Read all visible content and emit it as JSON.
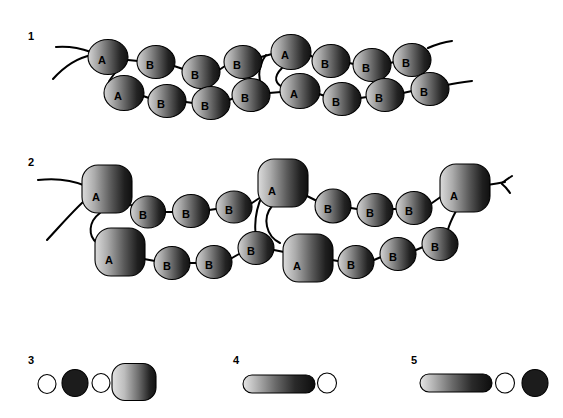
{
  "figure": {
    "background_color": "#ffffff",
    "ink_color": "#000000"
  },
  "panels": [
    {
      "id": "panel-1",
      "number": "1",
      "number_x": 28,
      "number_y": 31,
      "type": "double-chain",
      "subunit_style": "oval",
      "chains": [
        {
          "name": "upper-strand",
          "subunits": [
            {
              "label": "A",
              "cx": 108,
              "cy": 57,
              "rx": 20,
              "ry": 17.5,
              "shape": "oval"
            },
            {
              "label": "B",
              "cx": 156,
              "cy": 62,
              "rx": 19,
              "ry": 16.5,
              "shape": "oval"
            },
            {
              "label": "B",
              "cx": 201,
              "cy": 72,
              "rx": 19,
              "ry": 16.5,
              "shape": "oval"
            },
            {
              "label": "B",
              "cx": 243,
              "cy": 62,
              "rx": 19,
              "ry": 16.5,
              "shape": "oval"
            },
            {
              "label": "A",
              "cx": 291,
              "cy": 52,
              "rx": 20,
              "ry": 17.5,
              "shape": "oval"
            },
            {
              "label": "B",
              "cx": 331,
              "cy": 61,
              "rx": 19,
              "ry": 16.5,
              "shape": "oval"
            },
            {
              "label": "B",
              "cx": 372,
              "cy": 65,
              "rx": 19,
              "ry": 16.5,
              "shape": "oval"
            },
            {
              "label": "B",
              "cx": 412,
              "cy": 60,
              "rx": 19,
              "ry": 16.5,
              "shape": "oval"
            }
          ]
        },
        {
          "name": "lower-strand",
          "subunits": [
            {
              "label": "A",
              "cx": 124,
              "cy": 93,
              "rx": 20,
              "ry": 17.5,
              "shape": "oval"
            },
            {
              "label": "B",
              "cx": 167,
              "cy": 101,
              "rx": 19,
              "ry": 16.5,
              "shape": "oval"
            },
            {
              "label": "B",
              "cx": 211,
              "cy": 103,
              "rx": 19,
              "ry": 16.5,
              "shape": "oval"
            },
            {
              "label": "B",
              "cx": 251,
              "cy": 95,
              "rx": 19,
              "ry": 16.5,
              "shape": "oval"
            },
            {
              "label": "A",
              "cx": 300,
              "cy": 91,
              "rx": 20,
              "ry": 17.5,
              "shape": "oval"
            },
            {
              "label": "B",
              "cx": 342,
              "cy": 99,
              "rx": 19,
              "ry": 16.5,
              "shape": "oval"
            },
            {
              "label": "B",
              "cx": 385,
              "cy": 95,
              "rx": 19,
              "ry": 16.5,
              "shape": "oval"
            },
            {
              "label": "B",
              "cx": 430,
              "cy": 89,
              "rx": 19,
              "ry": 16.5,
              "shape": "oval"
            }
          ]
        }
      ]
    },
    {
      "id": "panel-2",
      "number": "2",
      "number_x": 28,
      "number_y": 157,
      "type": "double-chain",
      "subunit_style": "rounded-square-A",
      "chains": [
        {
          "name": "upper-strand",
          "subunits": [
            {
              "label": "A",
              "cx": 107,
              "cy": 189,
              "rx": 25,
              "ry": 24,
              "shape": "rounded-square"
            },
            {
              "label": "B",
              "cx": 148,
              "cy": 212,
              "rx": 17.5,
              "ry": 16,
              "shape": "oval"
            },
            {
              "label": "B",
              "cx": 191,
              "cy": 211,
              "rx": 18.5,
              "ry": 16.5,
              "shape": "oval"
            },
            {
              "label": "B",
              "cx": 234,
              "cy": 207,
              "rx": 18,
              "ry": 16,
              "shape": "oval"
            },
            {
              "label": "A",
              "cx": 283,
              "cy": 183,
              "rx": 25,
              "ry": 24,
              "shape": "rounded-square"
            },
            {
              "label": "B",
              "cx": 333,
              "cy": 206,
              "rx": 18,
              "ry": 17,
              "shape": "oval"
            },
            {
              "label": "B",
              "cx": 375,
              "cy": 210,
              "rx": 18,
              "ry": 16.5,
              "shape": "oval"
            },
            {
              "label": "B",
              "cx": 414,
              "cy": 208,
              "rx": 18,
              "ry": 16.5,
              "shape": "oval"
            },
            {
              "label": "A",
              "cx": 465,
              "cy": 188,
              "rx": 25,
              "ry": 24,
              "shape": "rounded-square"
            }
          ]
        },
        {
          "name": "lower-strand",
          "subunits": [
            {
              "label": "A",
              "cx": 120,
              "cy": 252,
              "rx": 25,
              "ry": 24,
              "shape": "rounded-square"
            },
            {
              "label": "B",
              "cx": 172,
              "cy": 263,
              "rx": 18,
              "ry": 16.5,
              "shape": "oval"
            },
            {
              "label": "B",
              "cx": 214,
              "cy": 262,
              "rx": 18,
              "ry": 16.5,
              "shape": "oval"
            },
            {
              "label": "B",
              "cx": 256,
              "cy": 248,
              "rx": 18,
              "ry": 16.5,
              "shape": "oval"
            },
            {
              "label": "A",
              "cx": 308,
              "cy": 258,
              "rx": 25,
              "ry": 24,
              "shape": "rounded-square"
            },
            {
              "label": "B",
              "cx": 356,
              "cy": 262,
              "rx": 18,
              "ry": 16.5,
              "shape": "oval"
            },
            {
              "label": "B",
              "cx": 398,
              "cy": 254,
              "rx": 18,
              "ry": 16.5,
              "shape": "oval"
            },
            {
              "label": "B",
              "cx": 440,
              "cy": 244,
              "rx": 18,
              "ry": 16.5,
              "shape": "oval"
            }
          ]
        }
      ]
    },
    {
      "id": "panel-3",
      "number": "3",
      "number_x": 28,
      "number_y": 355,
      "type": "particle-row",
      "particles": [
        {
          "kind": "open-circle",
          "cx": 47,
          "cy": 384,
          "rx": 9,
          "ry": 9.5
        },
        {
          "kind": "filled-circle",
          "cx": 75,
          "cy": 383,
          "rx": 13,
          "ry": 13.5
        },
        {
          "kind": "open-circle",
          "cx": 101,
          "cy": 383,
          "rx": 9,
          "ry": 9.5
        },
        {
          "kind": "gradient-rounded-square",
          "cx": 134,
          "cy": 382,
          "rx": 22,
          "ry": 18.5
        }
      ]
    },
    {
      "id": "panel-4",
      "number": "4",
      "number_x": 233,
      "number_y": 355,
      "type": "particle-row",
      "particles": [
        {
          "kind": "gradient-rod",
          "cx": 279,
          "cy": 384,
          "rx": 36,
          "ry": 9
        },
        {
          "kind": "open-circle",
          "cx": 327,
          "cy": 383,
          "rx": 9.5,
          "ry": 10
        }
      ]
    },
    {
      "id": "panel-5",
      "number": "5",
      "number_x": 411,
      "number_y": 355,
      "type": "particle-row",
      "particles": [
        {
          "kind": "gradient-rod",
          "cx": 456,
          "cy": 383,
          "rx": 36,
          "ry": 9
        },
        {
          "kind": "open-circle",
          "cx": 505,
          "cy": 383,
          "rx": 9.5,
          "ry": 10
        },
        {
          "kind": "filled-circle",
          "cx": 535,
          "cy": 383,
          "rx": 13,
          "ry": 13.5
        }
      ]
    }
  ],
  "subunit_labels": {
    "a": "A",
    "b": "B"
  },
  "colors": {
    "outline": "#000000",
    "gradient_light": "#d9d9d9",
    "gradient_mid": "#8a8a8a",
    "gradient_dark": "#1a1a1a",
    "filled_dark": "#1c1c1c",
    "open_fill": "#ffffff",
    "background": "#ffffff"
  }
}
